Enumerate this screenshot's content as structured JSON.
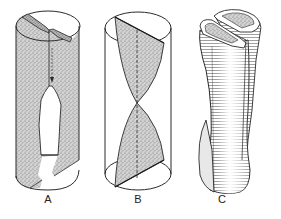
{
  "figure": {
    "panels": [
      {
        "id": "A",
        "label": "A",
        "description": "Cylinder with cut sheet, fold seam and downward arrow; opening cut-out in lower half"
      },
      {
        "id": "B",
        "label": "B",
        "description": "Transparent cylinder containing twisted hourglass-shaped stippled surface with dashed central axis"
      },
      {
        "id": "C",
        "label": "C",
        "description": "Rolled, scroll-like tube with two curled lips at top and hatched shading"
      }
    ],
    "colors": {
      "line": "#2a2a2a",
      "stipple": "#9a9a9a",
      "background": "#ffffff"
    }
  }
}
